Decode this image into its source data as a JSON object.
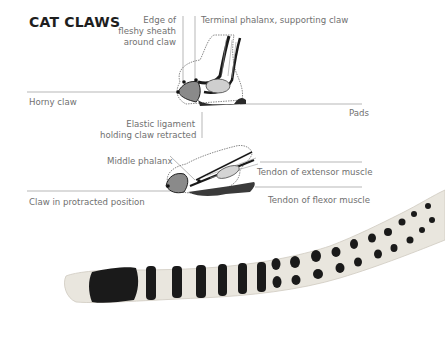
{
  "title": "CAT CLAWS",
  "labels": {
    "edge_sheath": [
      "Edge of",
      "fleshy sheath",
      "around claw"
    ],
    "terminal_phalanx": "Terminal phalanx, supporting claw",
    "horny_claw": "Horny claw",
    "pads": "Pads",
    "elastic_ligament": [
      "Elastic ligament",
      "holding claw retracted"
    ],
    "middle_phalanx": "Middle phalanx",
    "tendon_extensor": "Tendon of extensor muscle",
    "claw_protracted": "Claw in protracted position",
    "tendon_flexor": "Tendon of flexor muscle"
  },
  "figures": [
    {
      "name": "retracted-claw-illustration"
    },
    {
      "name": "protracted-claw-illustration"
    },
    {
      "name": "spotted-cat-tail-illustration"
    }
  ],
  "colors": {
    "title": "#1e1e1e",
    "label": "#707070",
    "leader_line": "#9a9a9a",
    "ink": "#1a1a1a",
    "fur": "#e9e6de"
  }
}
